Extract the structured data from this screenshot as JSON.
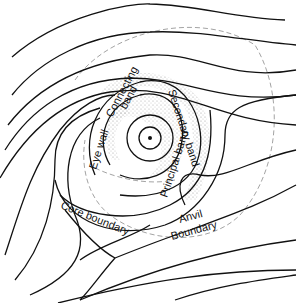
{
  "diagram": {
    "labels": {
      "eye_wall": "Eye wall",
      "connecting_band": "Connecting band",
      "connecting_band_line1": "Connecting",
      "connecting_band_line2": "band",
      "secondary_band": "Secondary band",
      "principal_band": "Principal band",
      "core_boundary": "Core boundary",
      "anvil_boundary_line1": "Anvil",
      "anvil_boundary_line2": "Boundary"
    },
    "elements": {
      "center": "storm-center-dot",
      "streamlines": "cyclonic inflow streamlines with arrowheads",
      "dashed_circle": "anvil boundary dashed outline",
      "stipple": "shaded rain band regions"
    },
    "colors": {
      "line": "#111111",
      "dashed": "#999999",
      "stipple": "#888888",
      "background": "#ffffff"
    }
  }
}
